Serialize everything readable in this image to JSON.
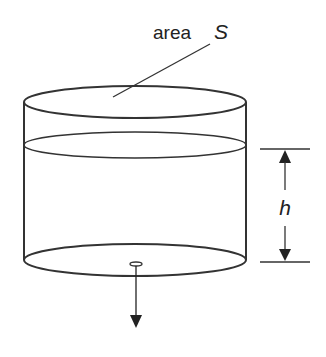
{
  "labels": {
    "area_word": "area",
    "area_symbol": "S",
    "height_symbol": "h"
  },
  "colors": {
    "stroke": "#333333",
    "background": "#ffffff",
    "text": "#222222"
  },
  "figure": {
    "elements": [
      "cylinder",
      "top-rim",
      "water-surface",
      "base",
      "drain-hole",
      "outflow-arrow",
      "height-dimension",
      "area-leader-line"
    ]
  }
}
